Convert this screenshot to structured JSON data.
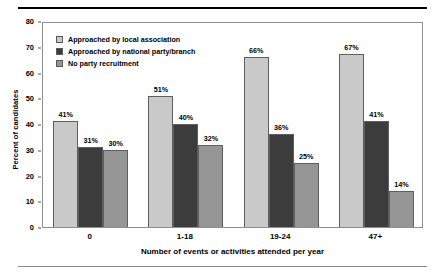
{
  "chart_data": {
    "type": "bar",
    "title": "",
    "xlabel": "Number of events or activities attended per year",
    "ylabel": "Percent of candidates",
    "categories": [
      "0",
      "1-18",
      "19-24",
      "47+"
    ],
    "ylim": [
      0,
      80
    ],
    "yticks": [
      0,
      10,
      20,
      30,
      40,
      50,
      60,
      70,
      80
    ],
    "grid": false,
    "legend_position": "top-left-inside",
    "series": [
      {
        "name": "Approached by local association",
        "color": "#c9c9c9",
        "values": [
          41,
          51,
          66,
          67
        ],
        "labels": [
          "41%",
          "51%",
          "66%",
          "67%"
        ]
      },
      {
        "name": "Approached by national party/branch",
        "color": "#3c3c3c",
        "values": [
          31,
          40,
          36,
          41
        ],
        "labels": [
          "31%",
          "40%",
          "36%",
          "41%"
        ]
      },
      {
        "name": "No party recruitment",
        "color": "#969696",
        "values": [
          30,
          32,
          25,
          14
        ],
        "labels": [
          "30%",
          "32%",
          "25%",
          "14%"
        ]
      }
    ]
  },
  "axis": {
    "tick_0": "0",
    "tick_10": "10",
    "tick_20": "20",
    "tick_30": "30",
    "tick_40": "40",
    "tick_50": "50",
    "tick_60": "60",
    "tick_70": "70",
    "tick_80": "80"
  }
}
